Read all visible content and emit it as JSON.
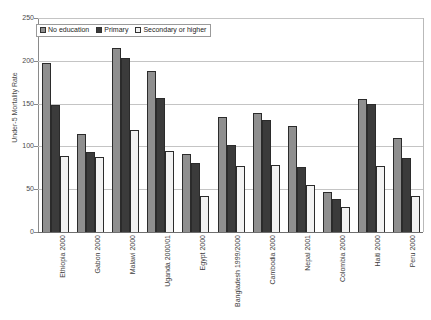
{
  "chart_data": {
    "type": "bar",
    "title": "",
    "xlabel": "",
    "ylabel": "Under-5 Mortality Rate",
    "ylim": [
      0,
      250
    ],
    "ytick_labels": [
      "250",
      "200",
      "150",
      "100",
      "50",
      "0"
    ],
    "ytick_values": [
      250,
      200,
      150,
      100,
      50,
      0
    ],
    "grid": true,
    "legend_position": "top-left",
    "categories": [
      "Ethiopia 2000",
      "Gabon 2000",
      "Malawi 2000",
      "Uganda 2000/01",
      "Egypt 2000",
      "Bangladesh 1999/2000",
      "Cambodia 2000",
      "Nepal 2001",
      "Colombia 2000",
      "Haiti 2000",
      "Peru 2000"
    ],
    "series": [
      {
        "name": "No education",
        "color": "#8f8f8f",
        "values": [
          198,
          114,
          215,
          188,
          91,
          134,
          139,
          124,
          47,
          155,
          110
        ]
      },
      {
        "name": "Primary",
        "color": "#3b3b3b",
        "values": [
          148,
          93,
          203,
          156,
          81,
          102,
          131,
          76,
          38,
          150,
          86
        ]
      },
      {
        "name": "Secondary or higher",
        "color": "#f2f2f2",
        "values": [
          89,
          88,
          119,
          95,
          42,
          77,
          78,
          55,
          29,
          77,
          42
        ]
      }
    ]
  },
  "legend": {
    "items": [
      {
        "label": "No education",
        "color": "#8f8f8f"
      },
      {
        "label": "Primary",
        "color": "#3b3b3b"
      },
      {
        "label": "Secondary or higher",
        "color": "#f2f2f2"
      }
    ]
  },
  "axes": {
    "y_title": "Under-5 Mortality Rate"
  }
}
